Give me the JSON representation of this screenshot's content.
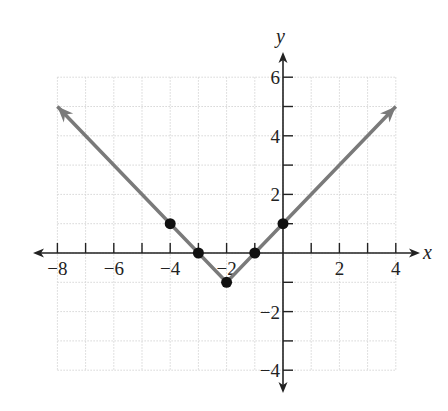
{
  "chart_data": {
    "type": "line",
    "title": "",
    "function": "y = |x + 2| - 1",
    "xlabel": "x",
    "ylabel": "y",
    "xlim": [
      -8,
      4
    ],
    "ylim": [
      -4,
      6
    ],
    "grid": true,
    "legend": null,
    "x_tick_labels": [
      "−8",
      "−6",
      "−4",
      "−2",
      "2",
      "4"
    ],
    "x_tick_values": [
      -8,
      -6,
      -4,
      -2,
      2,
      4
    ],
    "y_tick_labels": [
      "6",
      "4",
      "2",
      "−2",
      "−4"
    ],
    "y_tick_values": [
      6,
      4,
      2,
      -2,
      -4
    ],
    "series": [
      {
        "name": "y = |x + 2| - 1",
        "line_x": [
          -8,
          -2,
          4
        ],
        "line_y": [
          5,
          -1,
          5
        ],
        "arrows_both_ends": true,
        "color": "#7a7a7a"
      }
    ],
    "points": [
      {
        "x": -4,
        "y": 1
      },
      {
        "x": -3,
        "y": 0
      },
      {
        "x": -2,
        "y": -1
      },
      {
        "x": -1,
        "y": 0
      },
      {
        "x": 0,
        "y": 1
      }
    ],
    "colors": {
      "line": "#7a7a7a",
      "points": "#111111",
      "axes": "#222222",
      "grid": "#d6d6d6"
    }
  }
}
